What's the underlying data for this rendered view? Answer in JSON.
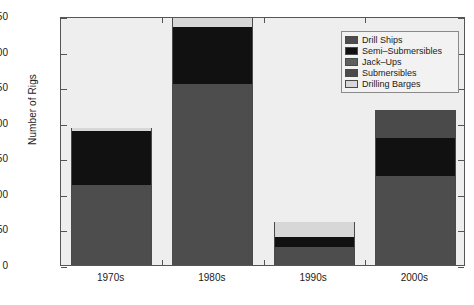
{
  "chart_data": {
    "type": "bar",
    "title": "",
    "subtitle": "",
    "xlabel": "",
    "ylabel": "Number of Rigs",
    "categories": [
      "1970s",
      "1980s",
      "1990s",
      "2000s"
    ],
    "ylim": [
      0,
      350
    ],
    "yticks": [
      0,
      50,
      100,
      150,
      200,
      250,
      300,
      350
    ],
    "ytick_labels": [
      "0",
      "50",
      "100",
      "150",
      "200",
      "250",
      "300",
      "350"
    ],
    "grid": false,
    "stacked": true,
    "legend_position": "top-right",
    "series": [
      {
        "name": "Drill Ships",
        "color": "#4d4d4d",
        "values": [
          112,
          255,
          25,
          125
        ]
      },
      {
        "name": "Semi–Submersibles",
        "color": "#111111",
        "values": [
          77,
          79,
          15,
          53
        ]
      },
      {
        "name": "Jack–Ups",
        "color": "#5e5e5e",
        "values": [
          0,
          0,
          0,
          0
        ]
      },
      {
        "name": "Submersibles",
        "color": "#4a4a4a",
        "values": [
          0,
          0,
          0,
          40
        ]
      },
      {
        "name": "Drilling Barges",
        "color": "#d7d7d7",
        "values": [
          4,
          13,
          21,
          0
        ]
      }
    ],
    "totals": [
      193,
      347,
      61,
      218
    ]
  },
  "legend": {
    "items": [
      {
        "label": "Drill Ships",
        "color": "#4d4d4d"
      },
      {
        "label": "Semi–Submersibles",
        "color": "#111111"
      },
      {
        "label": "Jack–Ups",
        "color": "#5e5e5e"
      },
      {
        "label": "Submersibles",
        "color": "#4a4a4a"
      },
      {
        "label": "Drilling Barges",
        "color": "#d7d7d7"
      }
    ]
  },
  "axes": {
    "y_title": "Number of Rigs",
    "y_ticks": [
      "0",
      "50",
      "100",
      "150",
      "200",
      "250",
      "300",
      "350"
    ],
    "x_ticks": [
      "1970s",
      "1980s",
      "1990s",
      "2000s"
    ]
  },
  "colors": {
    "plot_background": "#eeeeee",
    "axis": "#555555",
    "text": "#1a1a1a",
    "figure_background": "#ffffff"
  }
}
